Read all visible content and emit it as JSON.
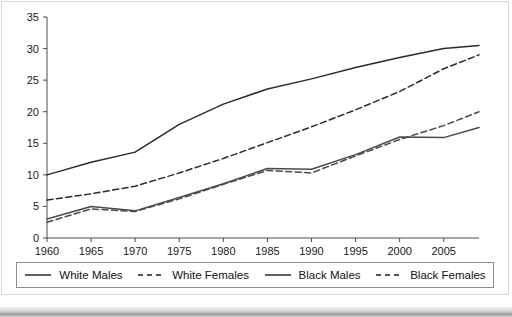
{
  "chart_data": {
    "type": "line",
    "title": "",
    "xlabel": "",
    "ylabel": "",
    "xlim": [
      1960,
      2009
    ],
    "ylim": [
      0,
      35
    ],
    "grid": false,
    "legend_position": "bottom",
    "xticks": [
      "1960",
      "1965",
      "1970",
      "1975",
      "1980",
      "1985",
      "1990",
      "1995",
      "2000",
      "2005"
    ],
    "xtick_values": [
      1960,
      1965,
      1970,
      1975,
      1980,
      1985,
      1990,
      1995,
      2000,
      2005
    ],
    "yticks": [
      "0",
      "5",
      "10",
      "15",
      "20",
      "25",
      "30",
      "35"
    ],
    "ytick_values": [
      0,
      5,
      10,
      15,
      20,
      25,
      30,
      35
    ],
    "x": [
      1960,
      1965,
      1970,
      1975,
      1980,
      1985,
      1990,
      1995,
      2000,
      2005,
      2009
    ],
    "series": [
      {
        "name": "White Males",
        "style": "solid",
        "color": "#2b2b2b",
        "values": [
          10.0,
          12.0,
          13.6,
          18.0,
          21.2,
          23.6,
          25.2,
          27.0,
          28.6,
          30.0,
          30.5
        ]
      },
      {
        "name": "White Females",
        "style": "dashed",
        "color": "#2b2b2b",
        "values": [
          6.0,
          7.0,
          8.2,
          10.3,
          12.6,
          15.1,
          17.6,
          20.3,
          23.2,
          26.8,
          29.0
        ]
      },
      {
        "name": "Black Males",
        "style": "solid",
        "color": "#4a4a4a",
        "values": [
          3.0,
          5.0,
          4.3,
          6.4,
          8.6,
          11.0,
          10.9,
          13.2,
          16.0,
          15.9,
          17.5
        ]
      },
      {
        "name": "Black Females",
        "style": "dashed",
        "color": "#4a4a4a",
        "values": [
          2.5,
          4.6,
          4.2,
          6.2,
          8.5,
          10.7,
          10.3,
          13.0,
          15.6,
          17.8,
          20.0
        ]
      }
    ]
  },
  "legend": {
    "entries": [
      {
        "label": "White Males",
        "style": "solid"
      },
      {
        "label": "White Females",
        "style": "dashed"
      },
      {
        "label": "Black Males",
        "style": "solid"
      },
      {
        "label": "Black Females",
        "style": "dashed"
      }
    ]
  },
  "colors": {
    "axis": "#4d4d4d",
    "text": "#1a1a1a",
    "plot_background": "#ffffff",
    "legend_border": "#8d8d8d",
    "page_border": "#d8d8d8"
  }
}
